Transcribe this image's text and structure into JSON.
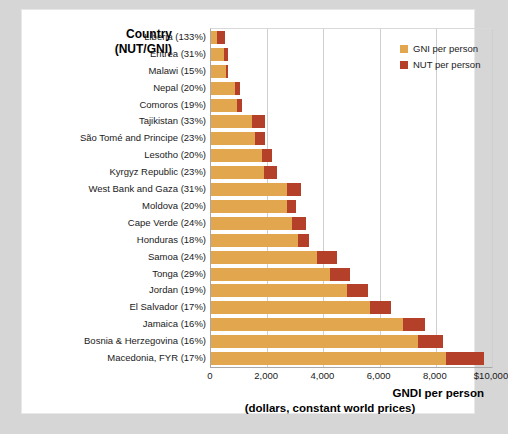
{
  "header": {
    "line1": "Country",
    "line2": "(NUT/GNI)"
  },
  "legend": {
    "items": [
      {
        "label": "GNI per person",
        "color": "#e2a64f",
        "key": "gni"
      },
      {
        "label": "NUT per person",
        "color": "#b5402a",
        "key": "nut"
      }
    ]
  },
  "axis_title": {
    "main": "GNDI per person",
    "sub": "(dollars, constant world prices)"
  },
  "chart_data": {
    "type": "bar",
    "orientation": "horizontal",
    "stacked": true,
    "title": "",
    "subtitle": "",
    "xlabel": "GNDI per person (dollars, constant world prices)",
    "ylabel": "Country (NUT/GNI)",
    "xlim": [
      0,
      10000
    ],
    "xticks": [
      0,
      2000,
      4000,
      6000,
      8000,
      10000
    ],
    "xticklabels": [
      "0",
      "2,000",
      "4,000",
      "6,000",
      "8,000",
      "$10,000"
    ],
    "grid": "vertical",
    "legend_position": "top-right",
    "categories": [
      "Liberia (133%)",
      "Eritrea (31%)",
      "Malawi (15%)",
      "Nepal (20%)",
      "Comoros (19%)",
      "Tajikistan (33%)",
      "São Tomé and Principe (23%)",
      "Lesotho (20%)",
      "Kyrgyz Republic (23%)",
      "West Bank and Gaza (31%)",
      "Moldova (20%)",
      "Cape Verde (24%)",
      "Honduras (18%)",
      "Samoa (24%)",
      "Tonga (29%)",
      "Jordan (19%)",
      "El Salvador (17%)",
      "Jamaica (16%)",
      "Bosnia & Herzegovina (16%)",
      "Macedonia, FYR (17%)"
    ],
    "series": [
      {
        "name": "GNI per person",
        "color": "#e2a64f",
        "values": [
          220,
          470,
          530,
          870,
          920,
          1450,
          1560,
          1800,
          1900,
          2700,
          2720,
          2880,
          3100,
          3760,
          4250,
          4850,
          5650,
          6850,
          7350,
          8350
        ]
      },
      {
        "name": "NUT per person",
        "color": "#b5402a",
        "values": [
          290,
          150,
          80,
          180,
          175,
          480,
          360,
          360,
          440,
          500,
          310,
          490,
          370,
          720,
          700,
          740,
          760,
          760,
          900,
          1350
        ]
      }
    ],
    "totals": [
      510,
      620,
      610,
      1050,
      1095,
      1930,
      1920,
      2160,
      2340,
      3200,
      3030,
      3370,
      3470,
      4480,
      4950,
      5590,
      6410,
      7610,
      8250,
      9700
    ]
  }
}
